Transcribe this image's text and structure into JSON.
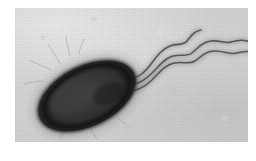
{
  "page": {
    "background_color": "#ffffff",
    "width": 256,
    "height": 161
  },
  "plate": {
    "name": "electron-micrograph",
    "technique": "negative-stain transmission electron micrograph",
    "background_color": "#d6d6d6",
    "frame": {
      "x": 15,
      "y": 8,
      "width": 233,
      "height": 134
    }
  },
  "specimen": {
    "label": "bacterial cell",
    "shape": "ovoid rod",
    "body_color": "#333333",
    "envelope_color": "#1d1d1d",
    "center": {
      "x": 72,
      "y": 88
    },
    "radius_x": 52,
    "radius_y": 30,
    "rotation_deg": -26
  },
  "flagella": {
    "label": "polar flagellar tuft",
    "count": 3,
    "color": "#555555",
    "insertion_point": {
      "x": 115,
      "y": 76
    },
    "waveform": "sinusoidal",
    "strands": [
      {
        "name": "flagellum-upper",
        "tip": {
          "x": 186,
          "y": 22
        }
      },
      {
        "name": "flagellum-middle",
        "tip": {
          "x": 244,
          "y": 38
        }
      },
      {
        "name": "flagellum-lower",
        "tip": {
          "x": 246,
          "y": 48
        }
      }
    ]
  },
  "fibrils": {
    "label": "fine surface fibrils",
    "color": "#9a9a9a"
  },
  "caption": {
    "text": "· · ·   ·· ·  ····· ·· ··· ···  ·· ·· ·  ··· ·· ··· ···· ··  ·· ··· · ···· ·· ·· ·· ···· ···"
  }
}
